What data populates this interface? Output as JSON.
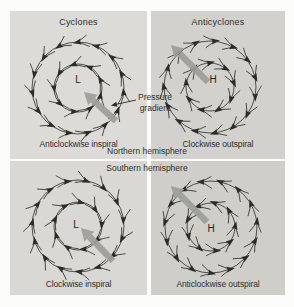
{
  "colors": {
    "page_bg": "#fcfcfa",
    "ink": "#2b2b28",
    "text": "#2f2f2d",
    "gradient_arrow": "#9e9e9a",
    "quadrant_bg": {
      "nh_cyclone": "#dcdbd7",
      "nh_anticyclone": "#d2d1cd",
      "sh_cyclone": "#d9d8d4",
      "sh_anticyclone": "#cfcec9"
    }
  },
  "hemisphere_labels": {
    "north": "Northern hemisphere",
    "south": "Southern hemisphere"
  },
  "pressure_gradient_label": {
    "line1": "Pressure",
    "line2": "gradient"
  },
  "quadrants": [
    {
      "key": "nh_cyclone",
      "title": "Cyclones",
      "center_letter": "L",
      "caption": "Anticlockwise inspiral",
      "rotation": "anticlockwise",
      "spiral": "inspiral",
      "geometry": {
        "w": 137,
        "h": 148,
        "cx": 68,
        "cy": 77,
        "outer_r": 46,
        "inner_r": 24,
        "letter_x": 68,
        "letter_y": 68,
        "grad_arrow": {
          "x1": 106,
          "y1": 110,
          "x2": 74,
          "y2": 81
        }
      }
    },
    {
      "key": "nh_anticyclone",
      "title": "Anticyclones",
      "center_letter": "H",
      "caption": "Clockwise outspiral",
      "rotation": "clockwise",
      "spiral": "outspiral",
      "geometry": {
        "w": 134,
        "h": 148,
        "cx": 59,
        "cy": 76,
        "outer_r": 46,
        "inner_r": 24,
        "letter_x": 62,
        "letter_y": 68,
        "grad_arrow": {
          "x1": 57,
          "y1": 71,
          "x2": 20,
          "y2": 34
        }
      }
    },
    {
      "key": "sh_cyclone",
      "title": "",
      "center_letter": "L",
      "caption": "Clockwise inspiral",
      "rotation": "clockwise",
      "spiral": "inspiral",
      "geometry": {
        "w": 137,
        "h": 134,
        "cx": 68,
        "cy": 65,
        "outer_r": 46,
        "inner_r": 24,
        "letter_x": 66,
        "letter_y": 63,
        "grad_arrow": {
          "x1": 103,
          "y1": 100,
          "x2": 71,
          "y2": 67
        }
      }
    },
    {
      "key": "sh_anticyclone",
      "title": "",
      "center_letter": "H",
      "caption": "Anticlockwise outspiral",
      "rotation": "anticlockwise",
      "spiral": "outspiral",
      "geometry": {
        "w": 134,
        "h": 134,
        "cx": 60,
        "cy": 66,
        "outer_r": 46,
        "inner_r": 24,
        "letter_x": 60,
        "letter_y": 67,
        "grad_arrow": {
          "x1": 56,
          "y1": 61,
          "x2": 20,
          "y2": 25
        }
      }
    }
  ]
}
